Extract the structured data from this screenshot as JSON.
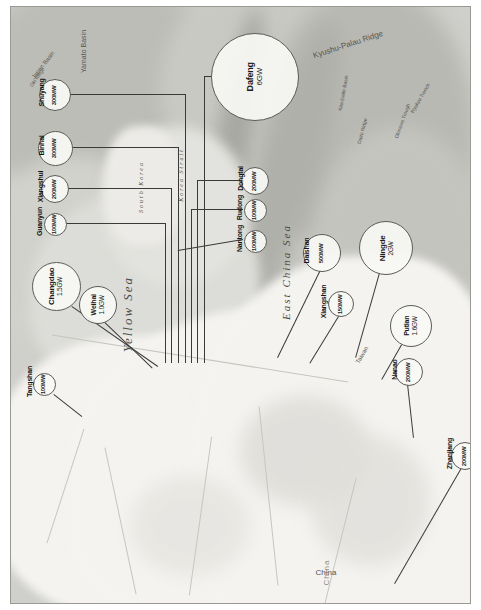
{
  "map": {
    "title": "Offshore wind projects along the China coast",
    "orientation": "rotated-90-ccw",
    "seas": [
      {
        "name": "Yellow Sea",
        "x": 118,
        "y": 308,
        "size": 13
      },
      {
        "name": "East China Sea",
        "x": 276,
        "y": 268,
        "size": 11
      },
      {
        "name": "South Korea",
        "x": 131,
        "y": 186,
        "size": 6
      },
      {
        "name": "Korea Strait",
        "x": 171,
        "y": 174,
        "size": 6
      }
    ],
    "features": [
      {
        "name": "Kyushu-Palau Ridge",
        "x": 338,
        "y": 40,
        "size": 8,
        "rotate": -18
      },
      {
        "name": "Yamato Basin",
        "x": 73,
        "y": 48,
        "size": 7,
        "rotate": -90
      },
      {
        "name": "Japan Basin",
        "x": 33,
        "y": 62,
        "size": 6,
        "rotate": -52
      },
      {
        "name": "Oki Ridge",
        "x": 27,
        "y": 74,
        "size": 5,
        "rotate": -55
      },
      {
        "name": "Okinawa Trough",
        "x": 392,
        "y": 118,
        "size": 5,
        "rotate": -70
      },
      {
        "name": "Ryukyu Trench",
        "x": 410,
        "y": 95,
        "size": 5,
        "rotate": -60
      },
      {
        "name": "Kita-Daito Basin",
        "x": 333,
        "y": 90,
        "size": 5,
        "rotate": -80
      },
      {
        "name": "Daito Ridge",
        "x": 352,
        "y": 128,
        "size": 5,
        "rotate": -75
      },
      {
        "name": "Taiwan",
        "x": 352,
        "y": 352,
        "size": 6,
        "rotate": -60
      },
      {
        "name": "China",
        "x": 316,
        "y": 568,
        "size": 8
      }
    ],
    "country_label": "China"
  },
  "projects": [
    {
      "id": "shuyang",
      "name": "Shuyang",
      "capacity": "300MW",
      "d": 30,
      "cx": 44,
      "cy": 88,
      "lx": 31,
      "ly": 88,
      "leader": {
        "x1": 59,
        "y1": 88,
        "x2": 175,
        "y2": 88,
        "vx": 175,
        "vy": 88,
        "vy2": 357
      }
    },
    {
      "id": "binhai",
      "name": "Binhai",
      "capacity": "300MW",
      "d": 33,
      "cx": 44,
      "cy": 141,
      "lx": 31,
      "ly": 141,
      "leader": {
        "x1": 60,
        "y1": 141,
        "x2": 168,
        "y2": 141,
        "vx": 168,
        "vy": 141,
        "vy2": 357
      }
    },
    {
      "id": "xiangshui",
      "name": "Xiangshui",
      "capacity": "200MW",
      "d": 26,
      "cx": 44,
      "cy": 182,
      "lx": 30,
      "ly": 182,
      "leader": {
        "x1": 57,
        "y1": 182,
        "x2": 161,
        "y2": 182,
        "vx": 161,
        "vy": 182,
        "vy2": 357
      }
    },
    {
      "id": "guanyun",
      "name": "Guanyun",
      "capacity": "100MW",
      "d": 21,
      "cx": 44,
      "cy": 217,
      "lx": 29,
      "ly": 217,
      "leader": {
        "x1": 55,
        "y1": 217,
        "x2": 155,
        "y2": 217,
        "vx": 155,
        "vy": 217,
        "vy2": 357
      }
    },
    {
      "id": "changdao",
      "name": "Changdao",
      "capacity": "1.5GW",
      "d": 47,
      "cx": 45,
      "cy": 279,
      "lx": 45,
      "ly": 279,
      "inside": true,
      "leader": {
        "x1": 62,
        "y1": 300,
        "x2": 148,
        "y2": 360,
        "diag": true
      }
    },
    {
      "id": "weihai",
      "name": "Weihai",
      "capacity": "1.0GW",
      "d": 36,
      "cx": 87,
      "cy": 298,
      "lx": 87,
      "ly": 298,
      "inside": true,
      "leader": {
        "x1": 95,
        "y1": 316,
        "x2": 143,
        "y2": 362,
        "diag": true
      }
    },
    {
      "id": "tangshan",
      "name": "Tangshan",
      "capacity": "100MW",
      "d": 21,
      "cx": 33,
      "cy": 377,
      "lx": 19,
      "ly": 377,
      "leader": {
        "x1": 44,
        "y1": 388,
        "x2": 72,
        "y2": 410,
        "diag": true
      }
    },
    {
      "id": "dafeng",
      "name": "Dafeng",
      "capacity": "6GW",
      "d": 86,
      "cx": 244,
      "cy": 70,
      "lx": 244,
      "ly": 70,
      "inside": true,
      "leader": {
        "x1": 201,
        "y1": 70,
        "x2": 194,
        "y2": 70,
        "vx": 194,
        "vy": 70,
        "vy2": 357
      }
    },
    {
      "id": "dongtai",
      "name": "Dongtai",
      "capacity": "200MW",
      "d": 26,
      "cx": 244,
      "cy": 174,
      "lx": 230,
      "ly": 174,
      "leader": {
        "x1": 231,
        "y1": 174,
        "x2": 187,
        "y2": 174,
        "vx": 187,
        "vy": 174,
        "vy2": 357
      }
    },
    {
      "id": "rudong",
      "name": "Rudong",
      "capacity": "100MW",
      "d": 21,
      "cx": 244,
      "cy": 203,
      "lx": 229,
      "ly": 203,
      "leader": {
        "x1": 233,
        "y1": 203,
        "x2": 181,
        "y2": 203,
        "vx": 181,
        "vy": 203,
        "vy2": 357
      }
    },
    {
      "id": "nantong",
      "name": "Nantong",
      "capacity": "100MW",
      "d": 21,
      "cx": 244,
      "cy": 234,
      "lx": 229,
      "ly": 234,
      "leader": {
        "x1": 233,
        "y1": 234,
        "x2": 168,
        "y2": 245,
        "diag": true
      }
    },
    {
      "id": "daishan",
      "name": "Daishan",
      "capacity": "500MW",
      "d": 36,
      "cx": 311,
      "cy": 246,
      "lx": 296,
      "ly": 246,
      "leader": {
        "x1": 311,
        "y1": 264,
        "x2": 268,
        "y2": 352,
        "diag": true
      }
    },
    {
      "id": "xiangshan",
      "name": "Xiangshan",
      "capacity": "150MW",
      "d": 24,
      "cx": 330,
      "cy": 297,
      "lx": 313,
      "ly": 297,
      "leader": {
        "x1": 330,
        "y1": 309,
        "x2": 300,
        "y2": 358,
        "diag": true
      }
    },
    {
      "id": "ningde",
      "name": "Ningde",
      "capacity": "2GW",
      "d": 52,
      "cx": 375,
      "cy": 241,
      "lx": 375,
      "ly": 241,
      "inside": true,
      "leader": {
        "x1": 370,
        "y1": 267,
        "x2": 346,
        "y2": 352,
        "diag": true
      }
    },
    {
      "id": "putian",
      "name": "Putian",
      "capacity": "1.6GW",
      "d": 40,
      "cx": 400,
      "cy": 319,
      "lx": 400,
      "ly": 319,
      "inside": true,
      "leader": {
        "x1": 392,
        "y1": 339,
        "x2": 372,
        "y2": 374,
        "diag": true
      }
    },
    {
      "id": "nanao",
      "name": "Nanao",
      "capacity": "200MW",
      "d": 26,
      "cx": 398,
      "cy": 365,
      "lx": 384,
      "ly": 365,
      "leader": {
        "x1": 398,
        "y1": 378,
        "x2": 404,
        "y2": 432,
        "diag": true
      }
    },
    {
      "id": "zhanjiang",
      "name": "Zhanjiang",
      "capacity": "200MW",
      "d": 26,
      "cx": 454,
      "cy": 449,
      "lx": 439,
      "ly": 449,
      "leader": {
        "x1": 452,
        "y1": 462,
        "x2": 385,
        "y2": 578,
        "diag": true
      }
    }
  ],
  "legend": {
    "bubble_meaning": "bubble area proportional to project capacity",
    "units": [
      "MW",
      "GW"
    ]
  }
}
